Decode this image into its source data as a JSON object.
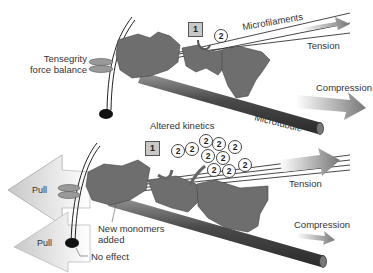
{
  "top_panel": {
    "labels": {
      "tensegrity": "Tensegrity",
      "force_balance": "force balance",
      "microfilaments": "Microfilaments",
      "tension": "Tension",
      "compression": "Compression",
      "microtubule": "Microtubule"
    },
    "step_box": "1",
    "step_circle": "2"
  },
  "bottom_panel": {
    "labels": {
      "altered_kinetics": "Altered kinetics",
      "tension": "Tension",
      "compression": "Compression",
      "new_monomers_1": "New monomers",
      "new_monomers_2": "added",
      "no_effect": "No effect",
      "pull_top": "Pull",
      "pull_bottom": "Pull"
    },
    "step_box": "1",
    "monomer_circles": [
      "2",
      "2",
      "2",
      "2",
      "2",
      "2",
      "2",
      "2",
      "2",
      "2"
    ]
  },
  "colors": {
    "protein": "#6e6e6e",
    "tube": "#5a5a5a",
    "arrow": "#8a8a8a",
    "pull_arrow": "#d8d8d8"
  }
}
